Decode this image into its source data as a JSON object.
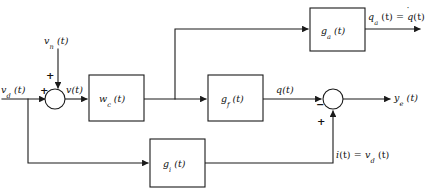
{
  "figure": {
    "type": "control-system-block-diagram",
    "background_color": "#ffffff",
    "line_color": "#1a1a1a"
  },
  "blocks": [
    {
      "id": "g_a",
      "name": "block-g-a",
      "label_main": "g",
      "label_sub": "a",
      "label_tail": " (t)",
      "x": 310,
      "y": 8,
      "w": 55,
      "h": 43
    },
    {
      "id": "w_c",
      "name": "block-w-c",
      "label_main": "w",
      "label_sub": "c",
      "label_tail": " (t)",
      "x": 89,
      "y": 75,
      "w": 55,
      "h": 46
    },
    {
      "id": "g_f",
      "name": "block-g-f",
      "label_main": "g",
      "label_sub": "f",
      "label_tail": " (t)",
      "x": 208,
      "y": 75,
      "w": 55,
      "h": 46
    },
    {
      "id": "g_i",
      "name": "block-g-i",
      "label_main": "g",
      "label_sub": "i",
      "label_tail": " (t)",
      "x": 150,
      "y": 139,
      "w": 55,
      "h": 48
    }
  ],
  "junctions": [
    {
      "id": "sum-left",
      "name": "summing-junction-input",
      "cx": 55,
      "cy": 99,
      "r": 10,
      "signs": [
        {
          "text": "+",
          "x": 42,
          "y": 88,
          "desc": "plus-for-vd"
        },
        {
          "text": "+",
          "x": 45,
          "y": 74,
          "desc": "plus-for-vn"
        }
      ]
    },
    {
      "id": "sum-right",
      "name": "summing-junction-output",
      "cx": 333,
      "cy": 99,
      "r": 10,
      "signs": [
        {
          "text": "−",
          "x": 317,
          "y": 104,
          "desc": "minus-for-q"
        },
        {
          "text": "+",
          "x": 319,
          "y": 122,
          "desc": "plus-for-i"
        }
      ]
    }
  ],
  "signal_labels": [
    {
      "id": "vn",
      "name": "label-vn",
      "text_main": "v",
      "sub": "n",
      "tail": " (t)",
      "x": 44,
      "y": 41
    },
    {
      "id": "vd",
      "name": "label-vd-input",
      "text_main": "v",
      "sub": "d",
      "tail": " (t)",
      "x": 2,
      "y": 88
    },
    {
      "id": "v",
      "name": "label-v",
      "text_main": "v",
      "sub": "",
      "tail": "(t)",
      "x": 65,
      "y": 86
    },
    {
      "id": "q",
      "name": "label-q",
      "text_main": "q",
      "sub": "",
      "tail": "(t)",
      "x": 275,
      "y": 86
    },
    {
      "id": "ye",
      "name": "label-ye",
      "text_main": "y",
      "sub": "e",
      "tail": " (t)",
      "x": 394,
      "y": 94
    }
  ],
  "equation_labels": [
    {
      "id": "qa",
      "name": "label-qa-equals-qdot",
      "x": 368,
      "y": 15,
      "parts": [
        {
          "t": "q",
          "style": "italic"
        },
        {
          "t": "a",
          "style": "sub"
        },
        {
          "t": " (t) = ",
          "style": "roman"
        },
        {
          "t": "q",
          "style": "italic-dot"
        },
        {
          "t": "(t)",
          "style": "roman"
        }
      ],
      "plain": "q_a (t) = q̇(t)"
    },
    {
      "id": "i",
      "name": "label-i-equals-vd",
      "x": 334,
      "y": 152,
      "parts": [
        {
          "t": "i",
          "style": "italic"
        },
        {
          "t": "(t) = ",
          "style": "roman"
        },
        {
          "t": "v",
          "style": "italic"
        },
        {
          "t": "d",
          "style": "sub"
        },
        {
          "t": " (t)",
          "style": "roman"
        }
      ],
      "plain": "i(t) = v_d (t)"
    }
  ],
  "wires": {
    "input_line": "M 2,99 L 45,99",
    "vn_drop": "M 58,49 L 58,89",
    "sum_to_wc": "M 65,99 L 89,99",
    "wc_to_branch": "M 144,99 L 208,99",
    "branch_up": "M 175,99 L 175,29 L 310,29",
    "gf_to_sum": "M 263,99 L 323,99",
    "sum_to_ye": "M 343,99 L 392,99",
    "ga_out": "M 365,29 L 421,29",
    "feedback_tap_down": "M 28,99 L 28,163 L 150,163",
    "gi_to_up": "M 205,163 L 333,163 L 333,110"
  },
  "tap_dots": [
    {
      "name": "branch-dot-wc-output",
      "cx": 175,
      "cy": 99
    },
    {
      "name": "branch-dot-input",
      "cx": 28,
      "cy": 99
    }
  ]
}
